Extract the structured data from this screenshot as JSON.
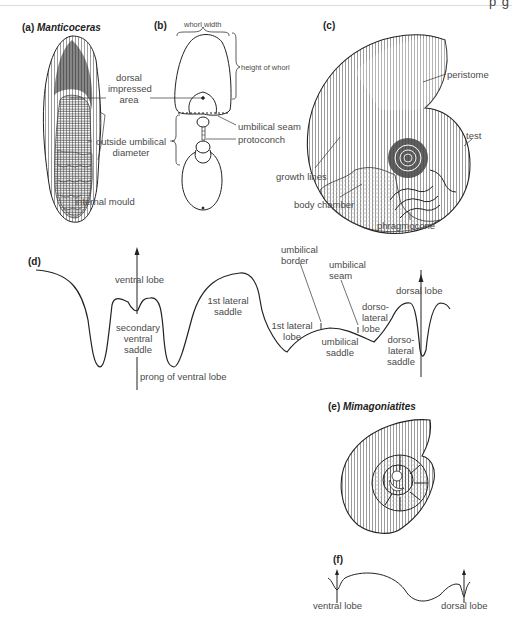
{
  "header": {
    "cropped_text": "' p   g"
  },
  "panels": {
    "a": {
      "letter": "(a)",
      "genus": "Manticoceras"
    },
    "b": {
      "letter": "(b)"
    },
    "c": {
      "letter": "(c)"
    },
    "d": {
      "letter": "(d)"
    },
    "e": {
      "letter": "(e)",
      "genus": "Mimagoniatites"
    },
    "f": {
      "letter": "(f)"
    }
  },
  "labels_ab": {
    "dorsal_impressed_area": [
      "dorsal",
      "impressed",
      "area"
    ],
    "outside_umbilical_diameter": [
      "outside umbilical",
      "diameter"
    ],
    "internal_mould": "internal mould",
    "whorl_width": "whorl width",
    "height_of_whorl": "height of whorl",
    "umbilical_seam": "umbilical seam",
    "protoconch": "protoconch"
  },
  "labels_c": {
    "peristome": "peristome",
    "test": "test",
    "growth_lines": "growth lines",
    "body_chamber": "body chamber",
    "phragmocone": "phragmocone"
  },
  "labels_d": {
    "ventral_lobe": "ventral lobe",
    "secondary_ventral_saddle": [
      "secondary",
      "ventral",
      "saddle"
    ],
    "prong_of_ventral_lobe": "prong of ventral lobe",
    "first_lateral_saddle": [
      "1st lateral",
      "saddle"
    ],
    "first_lateral_lobe": [
      "1st lateral",
      "lobe"
    ],
    "umbilical_border": [
      "umbilical",
      "border"
    ],
    "umbilical_seam": [
      "umbilical",
      "seam"
    ],
    "umbilical_saddle": [
      "umbilical",
      "saddle"
    ],
    "dorsolateral_lobe": [
      "dorso-",
      "lateral",
      "lobe"
    ],
    "dorsolateral_saddle": [
      "dorso-",
      "lateral",
      "saddle"
    ],
    "dorsal_lobe": "dorsal lobe"
  },
  "labels_f": {
    "ventral_lobe": "ventral lobe",
    "dorsal_lobe": "dorsal lobe"
  },
  "colors": {
    "ink": "#222222",
    "label": "#4a4a4a",
    "shade": "#9a9a9a",
    "paper": "#ffffff"
  }
}
